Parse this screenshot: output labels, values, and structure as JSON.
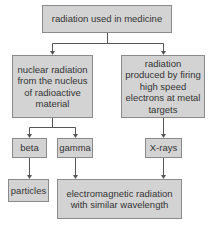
{
  "diagram": {
    "type": "flowchart",
    "colors": {
      "box_fill": "#d3d3d3",
      "box_border": "#8a8a8a",
      "connector": "#555555",
      "text": "#333333"
    },
    "nodes": {
      "root": {
        "label": "radiation used in medicine"
      },
      "nuclear": {
        "label": "nuclear radiation from the nucleus of radioactive material"
      },
      "produced": {
        "label": "radiation produced by firing high speed electrons at metal targets"
      },
      "beta": {
        "label": "beta"
      },
      "gamma": {
        "label": "gamma"
      },
      "xrays": {
        "label": "X-rays"
      },
      "particles": {
        "label": "particles"
      },
      "em": {
        "label": "electromagnetic radiation with similar wavelength"
      }
    },
    "edges": [
      {
        "from": "root",
        "to": "nuclear"
      },
      {
        "from": "root",
        "to": "produced"
      },
      {
        "from": "nuclear",
        "to": "beta"
      },
      {
        "from": "nuclear",
        "to": "gamma"
      },
      {
        "from": "produced",
        "to": "xrays"
      },
      {
        "from": "beta",
        "to": "particles"
      },
      {
        "from": "gamma",
        "to": "em"
      },
      {
        "from": "xrays",
        "to": "em"
      }
    ]
  }
}
